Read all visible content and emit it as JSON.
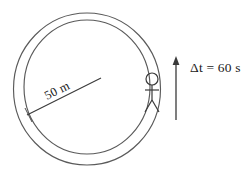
{
  "figure": {
    "track": {
      "shape": "annulus",
      "outer_circle_label": "outer-track-edge",
      "inner_circle_label": "inner-track-edge",
      "stroke_color": "#5a5a5a"
    },
    "radius": {
      "label": "50 m",
      "line_name": "radius-line"
    },
    "runner": {
      "name": "stick-figure-runner",
      "position": "right side of track"
    },
    "time_annotation": {
      "label": "Δt = 60 s",
      "arrow_direction": "up",
      "arrow_name": "direction-arrow"
    },
    "colors": {
      "ink": "#3a3a3a",
      "track_stroke": "#5a5a5a",
      "background": "#ffffff"
    }
  }
}
